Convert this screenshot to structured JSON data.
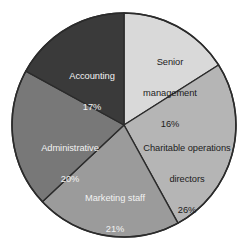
{
  "chart_data": {
    "type": "pie",
    "title": "",
    "subtitle": "",
    "xlabel": "",
    "ylabel": "",
    "legend_position": "none",
    "grid": false,
    "value_unit": "%",
    "start_angle_deg": 0,
    "direction": "clockwise",
    "categories": [
      "Senior management",
      "Charitable operations directors",
      "Marketing staff",
      "Administrative",
      "Accounting"
    ],
    "values": [
      16,
      26,
      21,
      20,
      17
    ],
    "slices": [
      {
        "label": "Senior management",
        "label_line1": "Senior",
        "label_line2": "management",
        "value": 16,
        "value_text": "16%",
        "color": "#d9d9d9",
        "text_color": "#1c1c1c"
      },
      {
        "label": "Charitable operations directors",
        "label_line1": "Charitable operations",
        "label_line2": "directors",
        "value": 26,
        "value_text": "26%",
        "color": "#b5b5b5",
        "text_color": "#1c1c1c"
      },
      {
        "label": "Marketing staff",
        "label_line1": "Marketing staff",
        "label_line2": "",
        "value": 21,
        "value_text": "21%",
        "color": "#9b9b9b",
        "text_color": "#f2f2f2"
      },
      {
        "label": "Administrative",
        "label_line1": "Administrative",
        "label_line2": "",
        "value": 20,
        "value_text": "20%",
        "color": "#787878",
        "text_color": "#f2f2f2"
      },
      {
        "label": "Accounting",
        "label_line1": "Accounting",
        "label_line2": "",
        "value": 17,
        "value_text": "17%",
        "color": "#3a3a3a",
        "text_color": "#f2f2f2"
      }
    ],
    "geometry": {
      "center_x": 124,
      "center_y": 125,
      "radius": 112,
      "outline_color": "#2b2b2b",
      "divider_color": "#2b2b2b",
      "background": "#ffffff"
    }
  }
}
